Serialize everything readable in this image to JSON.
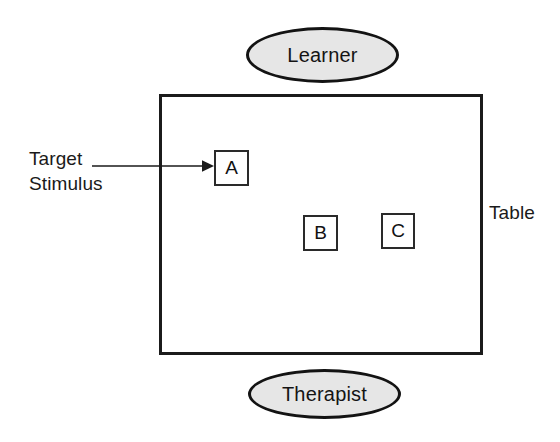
{
  "diagram": {
    "colors": {
      "ink": "#1a1a1a",
      "stroke": "#131313",
      "ellipse_fill": "#e6e6e6",
      "card_fill": "#ffffff",
      "background": "#ffffff"
    },
    "people": [
      {
        "id": "learner",
        "label": "Learner",
        "position": "top"
      },
      {
        "id": "therapist",
        "label": "Therapist",
        "position": "bottom"
      }
    ],
    "table": {
      "label": "Table",
      "label_position": "right-outside"
    },
    "cards": [
      {
        "id": "a",
        "label": "A",
        "role": "target-stimulus"
      },
      {
        "id": "b",
        "label": "B",
        "role": "comparison-stimulus"
      },
      {
        "id": "c",
        "label": "C",
        "role": "comparison-stimulus"
      }
    ],
    "annotation": {
      "line1": "Target",
      "line2": "Stimulus",
      "points_to": "A",
      "arrow": "right-arrow"
    }
  }
}
